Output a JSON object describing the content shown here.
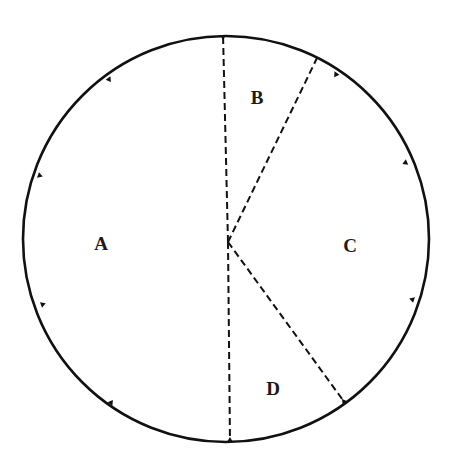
{
  "diagram": {
    "type": "circle-sector-division",
    "stroke_color": "#111111",
    "background": "#ffffff",
    "circle": {
      "cx": 226,
      "cy": 239,
      "r": 203
    },
    "center_point": {
      "x": 228,
      "y": 242
    },
    "dashed_lines": [
      {
        "id": "top",
        "x1": 228,
        "y1": 242,
        "x2": 223,
        "y2": 34
      },
      {
        "id": "upper-right",
        "x1": 228,
        "y1": 242,
        "x2": 317,
        "y2": 58
      },
      {
        "id": "lower-right",
        "x1": 228,
        "y1": 242,
        "x2": 345,
        "y2": 403
      },
      {
        "id": "bottom",
        "x1": 228,
        "y1": 242,
        "x2": 230,
        "y2": 443
      }
    ],
    "tick_marks": [
      {
        "x": 223,
        "y": 35
      },
      {
        "x": 337,
        "y": 73
      },
      {
        "x": 407,
        "y": 162
      },
      {
        "x": 414,
        "y": 300
      },
      {
        "x": 345,
        "y": 403
      },
      {
        "x": 230,
        "y": 442
      },
      {
        "x": 110,
        "y": 404
      },
      {
        "x": 41,
        "y": 305
      },
      {
        "x": 38,
        "y": 175
      },
      {
        "x": 108,
        "y": 78
      }
    ],
    "regions": [
      {
        "label": "A",
        "x": 101,
        "y": 250
      },
      {
        "label": "B",
        "x": 257,
        "y": 104
      },
      {
        "label": "C",
        "x": 350,
        "y": 252
      },
      {
        "label": "D",
        "x": 273,
        "y": 395
      }
    ]
  }
}
